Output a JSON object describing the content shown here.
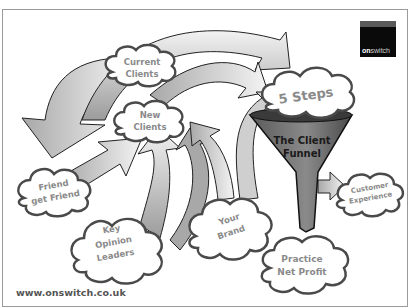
{
  "logo": {
    "brand_bold": "on",
    "brand_light": "switch"
  },
  "footer": {
    "url": "www.onswitch.co.uk"
  },
  "clouds": {
    "current_clients": {
      "line1": "Current",
      "line2": "Clients"
    },
    "new_clients": {
      "line1": "New",
      "line2": "Clients"
    },
    "five_steps": {
      "line1": "5 Steps"
    },
    "friend": {
      "line1": "Friend",
      "line2": "get Friend"
    },
    "key_opinion": {
      "line1": "Key",
      "line2": "Opinion",
      "line3": "Leaders"
    },
    "your_brand": {
      "line1": "Your",
      "line2": "Brand"
    },
    "customer_experience": {
      "line1": "Customer",
      "line2": "Experience"
    },
    "practice_net_profit": {
      "line1": "Practice",
      "line2": "Net Profit"
    }
  },
  "funnel": {
    "line1": "The Client",
    "line2": "Funnel"
  },
  "colors": {
    "arrow_dark": "#9a9a9a",
    "arrow_light": "#f2f2f2",
    "funnel": "#6e6e6e",
    "cloud_stroke": "#4a4a4a",
    "text": "#8a8a8a"
  }
}
